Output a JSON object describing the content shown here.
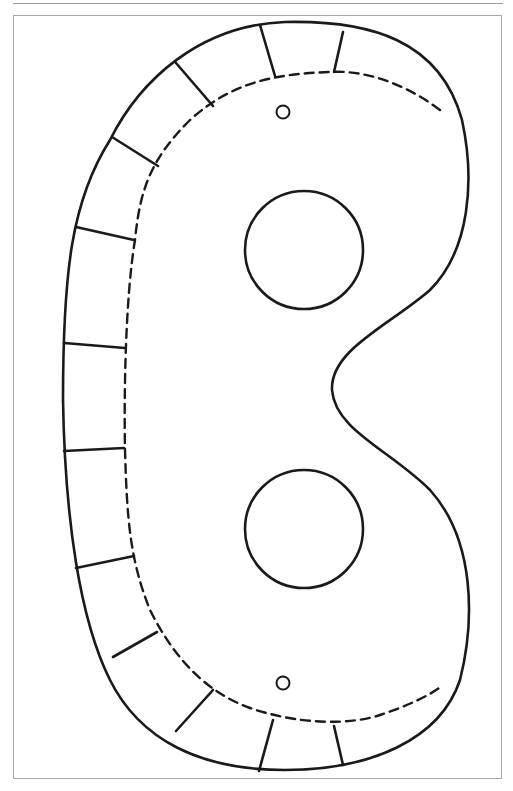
{
  "colors": {
    "line": "#1a1a1a",
    "frame": "#a8a8a8",
    "background": "#ffffff"
  },
  "mask": {
    "cut_line": "solid outer outline",
    "fold_line": "dashed inner outline",
    "tabs": 14,
    "eye_holes": 2,
    "string_holes": 2
  }
}
